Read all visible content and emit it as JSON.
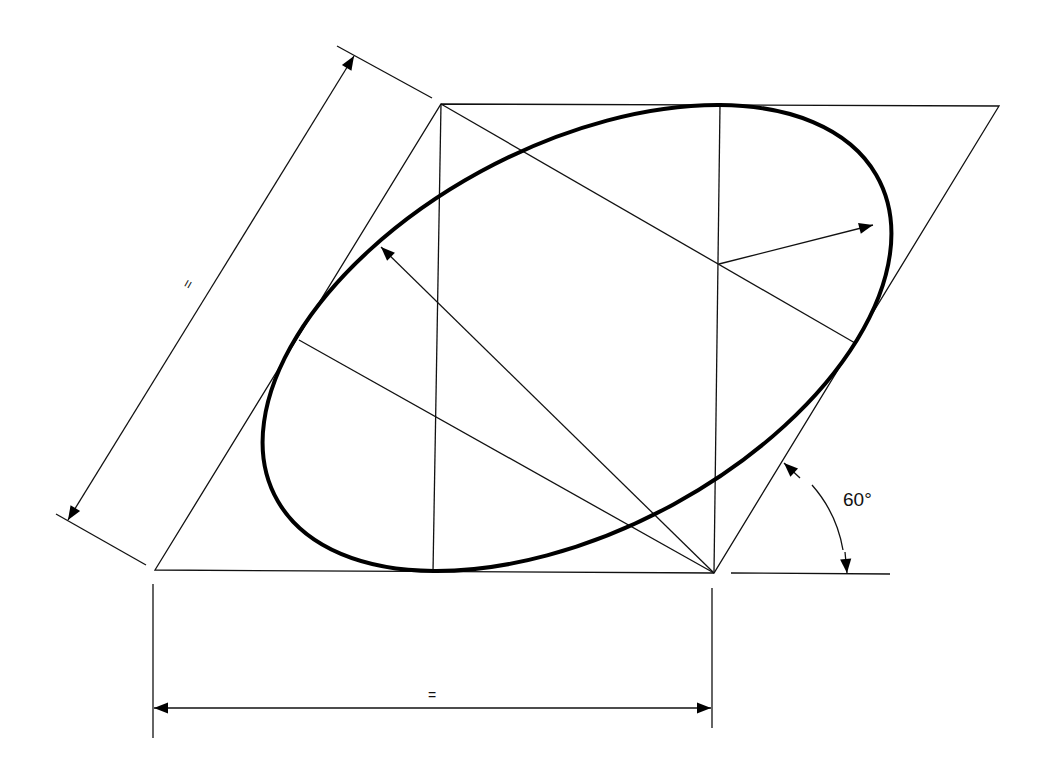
{
  "diagram": {
    "type": "isometric-ellipse-construction",
    "rhombus_angle_label": "60°",
    "width_dimension_label": "=",
    "side_dimension_label": "=",
    "colors": {
      "line": "#111111",
      "background": "#ffffff"
    }
  }
}
